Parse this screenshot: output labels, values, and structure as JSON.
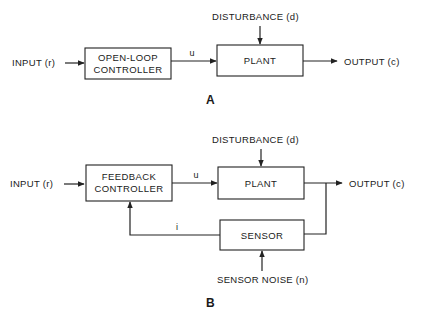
{
  "diagram_a": {
    "panel_label": "A",
    "input_label": "INPUT (r)",
    "controller_line1": "OPEN-LOOP",
    "controller_line2": "CONTROLLER",
    "control_signal": "u",
    "plant_label": "PLANT",
    "disturbance_label": "DISTURBANCE (d)",
    "output_label": "OUTPUT (c)"
  },
  "diagram_b": {
    "panel_label": "B",
    "input_label": "INPUT (r)",
    "controller_line1": "FEEDBACK",
    "controller_line2": "CONTROLLER",
    "control_signal": "u",
    "plant_label": "PLANT",
    "disturbance_label": "DISTURBANCE (d)",
    "output_label": "OUTPUT (c)",
    "sensor_label": "SENSOR",
    "feedback_signal": "i",
    "sensor_noise_label": "SENSOR NOISE (n)"
  },
  "colors": {
    "line": "#222222",
    "background": "#ffffff"
  }
}
